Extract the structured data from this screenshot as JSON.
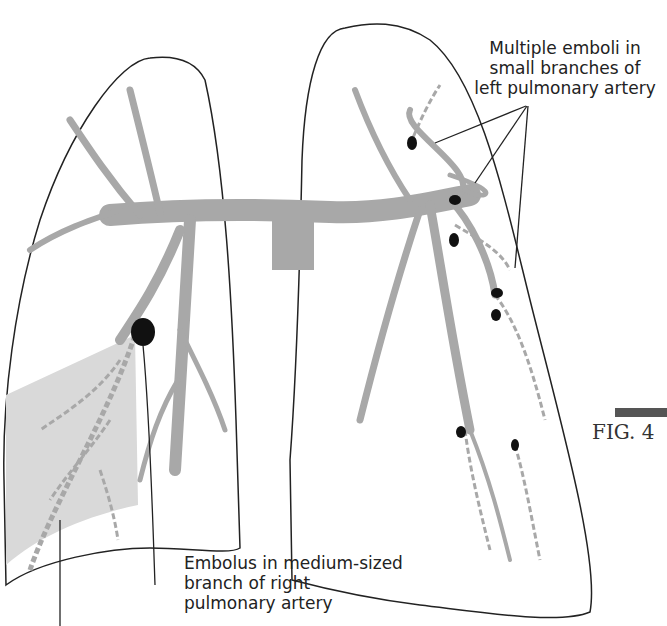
{
  "figure": {
    "type": "anatomical-diagram",
    "figure_label": "FIG. 4",
    "colors": {
      "artery": "#a8a8a8",
      "embolus": "#111111",
      "infarct_region": "#d9d9d9",
      "outline": "#222222"
    }
  },
  "labels": {
    "left_lung_emboli": "Multiple emboli in small branches of left pulmonary artery",
    "left_lung_emboli_lines": [
      "Multiple emboli in",
      "small branches of",
      "left pulmonary artery"
    ],
    "right_lung_embolus_lines": [
      "Embolus in medium-sized",
      "branch of right",
      "pulmonary artery"
    ]
  }
}
